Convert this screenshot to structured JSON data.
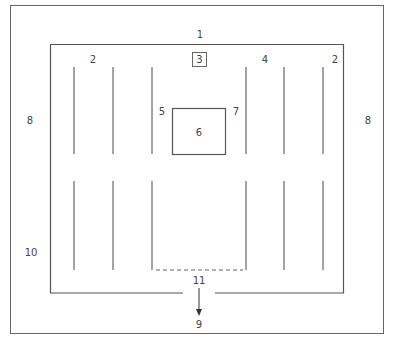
{
  "diagram": {
    "labels": {
      "outer_top": "1",
      "upper_left_aisle": "2",
      "center_box": "3",
      "upper_right_inner": "4",
      "upper_right_aisle": "2",
      "center_left": "5",
      "center": "6",
      "center_right": "7",
      "left_side": "8",
      "right_side": "8",
      "exit": "9",
      "lower_left": "10",
      "doorway": "11"
    },
    "colors": {
      "stroke": "#555555",
      "text": "#444444",
      "background": "#ffffff"
    }
  }
}
